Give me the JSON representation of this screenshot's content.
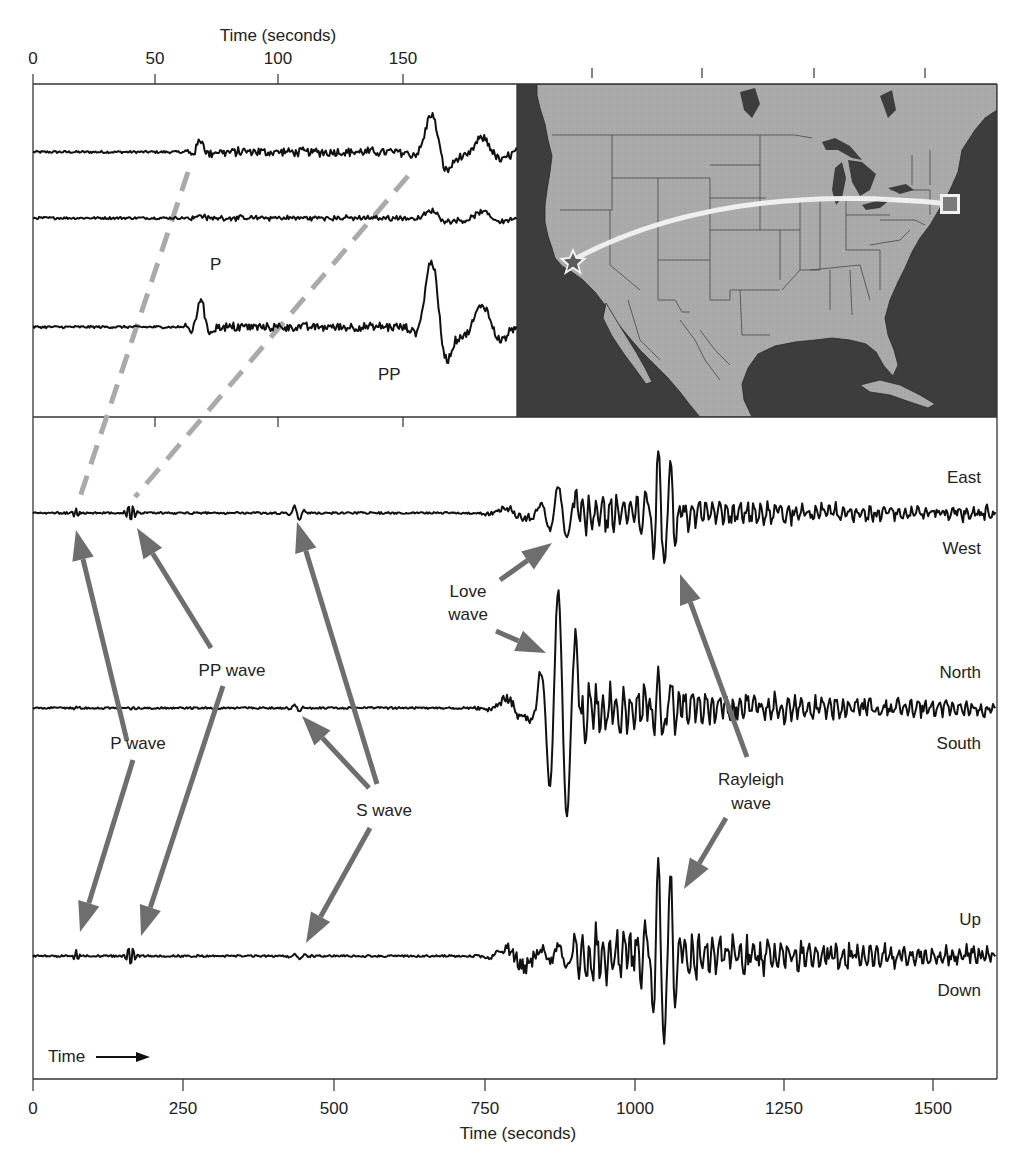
{
  "chart_data": {
    "type": "line",
    "title": "",
    "main": {
      "xlabel": "Time (seconds)",
      "xlim": [
        0,
        1600
      ],
      "x_ticks": [
        0,
        250,
        500,
        750,
        1000,
        1250,
        1500
      ],
      "grid": false,
      "series": [
        {
          "name": "East-West",
          "labels": {
            "top": "East",
            "bottom": "West"
          },
          "baseline_order": 1,
          "events": [
            {
              "phase": "P",
              "t": 70
            },
            {
              "phase": "PP",
              "t": 162
            },
            {
              "phase": "S",
              "t": 435
            },
            {
              "phase": "Love",
              "t": 880
            },
            {
              "phase": "Rayleigh",
              "t": 1050
            }
          ],
          "peak_amplitude_rel": 0.6
        },
        {
          "name": "North-South",
          "labels": {
            "top": "North",
            "bottom": "South"
          },
          "baseline_order": 2,
          "events": [
            {
              "phase": "S",
              "t": 435
            },
            {
              "phase": "Love",
              "t": 870
            }
          ],
          "peak_amplitude_rel": 1.0
        },
        {
          "name": "Up-Down",
          "labels": {
            "top": "Up",
            "bottom": "Down"
          },
          "baseline_order": 3,
          "events": [
            {
              "phase": "P",
              "t": 70
            },
            {
              "phase": "PP",
              "t": 162
            },
            {
              "phase": "S",
              "t": 440
            },
            {
              "phase": "Rayleigh",
              "t": 1050
            }
          ],
          "peak_amplitude_rel": 0.95
        }
      ],
      "annotations": [
        "P wave",
        "PP wave",
        "S wave",
        "Love wave",
        "Rayleigh wave",
        "Time →"
      ]
    },
    "inset": {
      "xlabel": "Time (seconds)",
      "xlim": [
        0,
        195
      ],
      "x_ticks": [
        0,
        50,
        100,
        150
      ],
      "traces": 3,
      "annotations": [
        "P",
        "PP"
      ],
      "events": [
        {
          "phase": "P",
          "t": 70
        },
        {
          "phase": "PP",
          "t": 162
        }
      ]
    },
    "map": {
      "region": "North America (USA, southern Canada, Mexico)",
      "source_marker": "star (California coast)",
      "station_marker": "square (New England)",
      "path": "great-circle arc from source to station"
    }
  },
  "labels": {
    "top_axis_title": "Time (seconds)",
    "top_ticks": [
      "0",
      "50",
      "100",
      "150"
    ],
    "bottom_axis_title": "Time (seconds)",
    "bottom_ticks": [
      "0",
      "250",
      "500",
      "750",
      "1000",
      "1250",
      "1500"
    ],
    "inset_p": "P",
    "inset_pp": "PP",
    "east": "East",
    "west": "West",
    "north": "North",
    "south": "South",
    "up": "Up",
    "down": "Down",
    "p_wave": "P wave",
    "pp_wave": "PP wave",
    "s_wave": "S wave",
    "love_1": "Love",
    "love_2": "wave",
    "rayleigh_1": "Rayleigh",
    "rayleigh_2": "wave",
    "time_arrow": "Time"
  },
  "colors": {
    "trace": "#111111",
    "arrow": "#6e6e6e",
    "dashed": "#aaaaaa",
    "ocean": "#3d3d3d",
    "land": "#a9a9a9",
    "border": "#333333"
  }
}
